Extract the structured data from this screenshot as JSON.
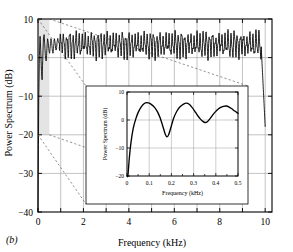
{
  "figure": {
    "panel_label": "(b)",
    "background_color": "#ffffff",
    "axis_color": "#000000",
    "grid_color": "#999999",
    "curve_color": "#000000",
    "shade_color": "#e2e2e2",
    "dashed_color": "#555555"
  },
  "chart_data": {
    "type": "line",
    "title": "",
    "xlabel": "Frequency (kHz)",
    "ylabel": "Power Spectrum (dB)",
    "xlim": [
      0,
      10.3
    ],
    "ylim": [
      -40,
      10
    ],
    "xticks": [
      0,
      2,
      4,
      6,
      8,
      10
    ],
    "xtick_labels": [
      "0",
      "2",
      "4",
      "6",
      "8",
      "10"
    ],
    "xminorticks": [
      1,
      3,
      5,
      7,
      9
    ],
    "yticks": [
      10,
      0,
      -10,
      -20,
      -30,
      -40
    ],
    "ytick_labels": [
      "10",
      "0",
      "−10",
      "−20",
      "−30",
      "−40"
    ],
    "grid": true,
    "legend": "none",
    "highlight_region": {
      "x0": 0,
      "x1": 0.5,
      "y0": -20,
      "y1": 10
    },
    "series": [
      {
        "name": "Power Spectrum",
        "x": [
          0.0,
          0.03,
          0.06,
          0.09,
          0.12,
          0.15,
          0.18,
          0.21,
          0.24,
          0.27,
          0.3,
          0.33,
          0.36,
          0.39,
          0.42,
          0.45,
          0.48,
          0.51,
          0.54,
          0.57,
          0.6,
          0.63,
          0.66,
          0.69,
          0.72,
          0.75,
          0.78,
          0.81,
          0.84,
          0.87,
          0.9,
          1.0,
          1.2,
          1.4,
          1.6,
          1.8,
          2.0,
          2.5,
          3.0,
          3.5,
          4.0,
          4.5,
          5.0,
          5.5,
          6.0,
          6.5,
          7.0,
          7.5,
          8.0,
          8.5,
          9.0,
          9.5,
          9.8,
          10.0
        ],
        "y": [
          -40,
          -12,
          0,
          6,
          2,
          -3,
          -6,
          0,
          5,
          6,
          3,
          0,
          -1,
          2,
          5,
          4,
          2,
          1,
          3,
          5,
          4,
          2,
          1,
          3,
          5,
          4,
          2,
          2,
          4,
          5,
          4,
          3,
          4,
          3,
          4,
          3,
          4,
          3,
          4,
          3,
          4,
          3,
          4,
          3,
          4,
          3,
          4,
          3,
          4,
          3,
          4,
          3,
          2,
          -18
        ],
        "description": "dense rapidly oscillating spectrum, envelope roughly 0 to 7 dB after initial transient, steep drop at 10 kHz"
      }
    ]
  },
  "inset": {
    "chart_data": {
      "type": "line",
      "title": "",
      "xlabel": "Frequency (kHz)",
      "ylabel": "Power Spectrum (dB)",
      "xlim": [
        0,
        0.5
      ],
      "ylim": [
        -20,
        10
      ],
      "xticks": [
        0,
        0.1,
        0.2,
        0.3,
        0.4,
        0.5
      ],
      "xtick_labels": [
        "0",
        "0.1",
        "0.2",
        "0.3",
        "0.4",
        "0.5"
      ],
      "yticks": [
        10,
        0,
        -10,
        -20
      ],
      "ytick_labels": [
        "10",
        "0",
        "−10",
        "−20"
      ],
      "grid": true,
      "legend": "none",
      "series": [
        {
          "name": "Power Spectrum (zoom)",
          "x": [
            0.004,
            0.01,
            0.018,
            0.028,
            0.04,
            0.052,
            0.065,
            0.078,
            0.09,
            0.1,
            0.112,
            0.125,
            0.138,
            0.15,
            0.162,
            0.172,
            0.18,
            0.188,
            0.198,
            0.21,
            0.225,
            0.24,
            0.255,
            0.268,
            0.28,
            0.292,
            0.305,
            0.318,
            0.33,
            0.342,
            0.352,
            0.362,
            0.375,
            0.39,
            0.405,
            0.42,
            0.435,
            0.448,
            0.46,
            0.472,
            0.485,
            0.5
          ],
          "y": [
            -20.0,
            -14.0,
            -8.0,
            -3.0,
            0.5,
            3.0,
            4.8,
            5.9,
            6.2,
            6.0,
            5.4,
            4.4,
            2.8,
            0.6,
            -2.4,
            -5.0,
            -6.0,
            -5.2,
            -2.6,
            0.6,
            3.2,
            4.8,
            5.7,
            6.0,
            5.6,
            4.6,
            3.2,
            1.6,
            0.4,
            -0.5,
            -0.9,
            -0.6,
            0.6,
            2.2,
            3.5,
            4.4,
            4.9,
            5.0,
            4.6,
            4.0,
            3.2,
            2.4
          ],
          "description": "three-lobed spectral shape with nulls at 0.18 and 0.352 kHz"
        }
      ]
    }
  }
}
